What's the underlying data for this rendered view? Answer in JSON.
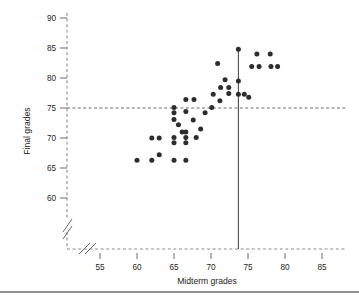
{
  "chart_data": {
    "type": "scatter",
    "title": "",
    "xlabel": "Midterm grades",
    "ylabel": "Final grades",
    "xticks": [
      55,
      60,
      65,
      70,
      75,
      80,
      85
    ],
    "yticks": [
      60,
      65,
      70,
      75,
      80,
      85,
      90
    ],
    "xlim": [
      52,
      86.5
    ],
    "ylim": [
      57.5,
      90.5
    ],
    "grid": false,
    "legend": null,
    "axis_break_x": true,
    "axis_break_y": true,
    "reference_lines": [
      {
        "orientation": "horizontal",
        "value": 75,
        "style": "dashed",
        "label": ""
      },
      {
        "orientation": "vertical",
        "value": 73.7,
        "style": "solid",
        "label": ""
      }
    ],
    "points": [
      {
        "x": 60.0,
        "y": 66.3
      },
      {
        "x": 62.0,
        "y": 66.3
      },
      {
        "x": 62.0,
        "y": 70.0
      },
      {
        "x": 63.0,
        "y": 67.2
      },
      {
        "x": 63.0,
        "y": 70.0
      },
      {
        "x": 65.0,
        "y": 66.3
      },
      {
        "x": 65.0,
        "y": 69.2
      },
      {
        "x": 65.0,
        "y": 70.1
      },
      {
        "x": 65.0,
        "y": 73.1
      },
      {
        "x": 65.0,
        "y": 74.2
      },
      {
        "x": 65.0,
        "y": 75.1
      },
      {
        "x": 65.6,
        "y": 72.2
      },
      {
        "x": 66.1,
        "y": 71.0
      },
      {
        "x": 66.6,
        "y": 66.3
      },
      {
        "x": 66.6,
        "y": 69.2
      },
      {
        "x": 66.6,
        "y": 70.1
      },
      {
        "x": 66.6,
        "y": 71.0
      },
      {
        "x": 66.6,
        "y": 74.4
      },
      {
        "x": 66.6,
        "y": 76.4
      },
      {
        "x": 67.6,
        "y": 73.0
      },
      {
        "x": 67.7,
        "y": 76.4
      },
      {
        "x": 68.0,
        "y": 70.1
      },
      {
        "x": 68.6,
        "y": 71.5
      },
      {
        "x": 69.2,
        "y": 74.2
      },
      {
        "x": 70.1,
        "y": 75.1
      },
      {
        "x": 70.3,
        "y": 77.3
      },
      {
        "x": 70.9,
        "y": 82.4
      },
      {
        "x": 71.2,
        "y": 76.2
      },
      {
        "x": 71.3,
        "y": 78.4
      },
      {
        "x": 71.9,
        "y": 79.7
      },
      {
        "x": 72.4,
        "y": 78.4
      },
      {
        "x": 72.4,
        "y": 77.4
      },
      {
        "x": 73.7,
        "y": 84.8
      },
      {
        "x": 73.7,
        "y": 79.5
      },
      {
        "x": 73.7,
        "y": 77.3
      },
      {
        "x": 74.5,
        "y": 77.3
      },
      {
        "x": 75.1,
        "y": 76.8
      },
      {
        "x": 75.5,
        "y": 81.9
      },
      {
        "x": 76.2,
        "y": 84.0
      },
      {
        "x": 76.5,
        "y": 81.9
      },
      {
        "x": 78.0,
        "y": 84.0
      },
      {
        "x": 78.1,
        "y": 81.9
      },
      {
        "x": 79.0,
        "y": 81.9
      }
    ]
  },
  "axis": {
    "x_title": "Midterm grades",
    "y_title": "Final grades",
    "x_tick_labels": [
      "55",
      "60",
      "65",
      "70",
      "75",
      "80",
      "85"
    ],
    "y_tick_labels": [
      "60",
      "65",
      "70",
      "75",
      "80",
      "85",
      "90"
    ]
  },
  "style": {
    "point_color": "#2d2d2d",
    "frame_color": "#8d8d8d",
    "reference_solid_color": "#3b3b3b",
    "text_color": "#231f20",
    "background": "#ffffff"
  }
}
